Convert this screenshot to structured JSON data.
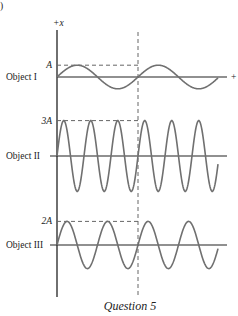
{
  "figure": {
    "corner_mark": ")",
    "axis_label_vertical": "+x",
    "axis_label_horizontal": "+",
    "caption": "Question 5",
    "wave_color": "#707070",
    "axis_color": "#222222",
    "dash_color": "#666666",
    "objects": [
      {
        "name": "Object I",
        "amplitude_label": "A",
        "amplitude_multiple": 1,
        "cycles_before_dashed": 1,
        "total_cycles": 2
      },
      {
        "name": "Object II",
        "amplitude_label": "3A",
        "amplitude_multiple": 3,
        "cycles_before_dashed": 3,
        "total_cycles": 6
      },
      {
        "name": "Object III",
        "amplitude_label": "2A",
        "amplitude_multiple": 2,
        "cycles_before_dashed": 2,
        "total_cycles": 4
      }
    ]
  }
}
